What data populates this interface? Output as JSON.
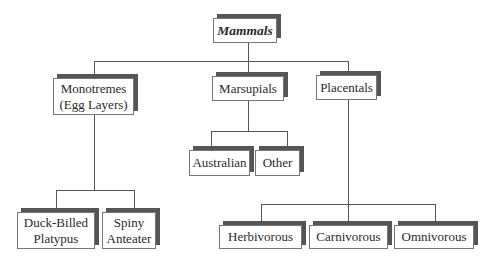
{
  "diagram": {
    "title": "Mammals",
    "root": {
      "label": "Mammals",
      "style": "bold-italic"
    },
    "level1": [
      {
        "id": "monotremes",
        "label_line1": "Monotremes",
        "label_line2": "(Egg Layers)"
      },
      {
        "id": "marsupials",
        "label": "Marsupials"
      },
      {
        "id": "placentals",
        "label": "Placentals"
      }
    ],
    "monotremes_children": [
      {
        "id": "duck-billed-platypus",
        "label_line1": "Duck-Billed",
        "label_line2": "Platypus"
      },
      {
        "id": "spiny-anteater",
        "label_line1": "Spiny",
        "label_line2": "Anteater"
      }
    ],
    "marsupials_children": [
      {
        "id": "australian",
        "label": "Australian"
      },
      {
        "id": "other",
        "label": "Other"
      }
    ],
    "placentals_children": [
      {
        "id": "herbivorous",
        "label": "Herbivorous"
      },
      {
        "id": "carnivorous",
        "label": "Carnivorous"
      },
      {
        "id": "omnivorous",
        "label": "Omnivorous"
      }
    ],
    "colors": {
      "box_border": "#777777",
      "shadow": "#555555",
      "connector": "#555555",
      "background": "#ffffff"
    }
  }
}
